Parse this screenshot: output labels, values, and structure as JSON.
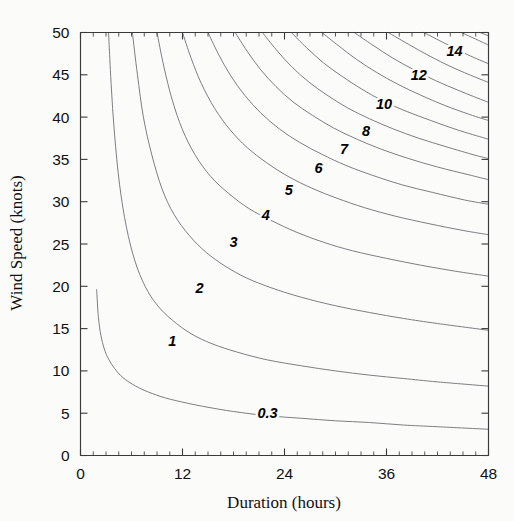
{
  "chart_data": {
    "type": "line",
    "title": "",
    "subtitle": "",
    "xlabel": "Duration (hours)",
    "ylabel": "Wind Speed (knots)",
    "xlim": [
      0,
      48
    ],
    "ylim": [
      0,
      50
    ],
    "xticks": [
      0,
      12,
      24,
      36,
      48
    ],
    "xtick_labels": [
      "0",
      "12",
      "24",
      "36",
      "48"
    ],
    "x_minor_tick_interval": 1.5,
    "yticks": [
      0,
      5,
      10,
      15,
      20,
      25,
      30,
      35,
      40,
      45,
      50
    ],
    "ytick_labels": [
      "0",
      "5",
      "10",
      "15",
      "20",
      "25",
      "30",
      "35",
      "40",
      "45",
      "50"
    ],
    "grid": false,
    "legend": "none",
    "annotations": [
      {
        "text": "0.3",
        "x": 22.0,
        "y": 4.4
      },
      {
        "text": "1",
        "x": 10.8,
        "y": 13.0
      },
      {
        "text": "2",
        "x": 14.0,
        "y": 19.2
      },
      {
        "text": "3",
        "x": 18.0,
        "y": 24.6
      },
      {
        "text": "4",
        "x": 21.8,
        "y": 27.8
      },
      {
        "text": "5",
        "x": 24.5,
        "y": 30.8
      },
      {
        "text": "6",
        "x": 28.0,
        "y": 33.4
      },
      {
        "text": "7",
        "x": 31.0,
        "y": 35.6
      },
      {
        "text": "8",
        "x": 33.6,
        "y": 37.8
      },
      {
        "text": "10",
        "x": 35.7,
        "y": 41.0
      },
      {
        "text": "12",
        "x": 39.8,
        "y": 44.4
      },
      {
        "text": "14",
        "x": 44.0,
        "y": 47.2
      }
    ],
    "contour_levels": [
      0.3,
      1,
      2,
      3,
      4,
      5,
      6,
      7,
      8,
      10,
      12,
      14
    ],
    "contour_label": "Significant wave height",
    "series": [
      {
        "name": "0.3",
        "points": [
          [
            1.9,
            19.6
          ],
          [
            2.1,
            16.4
          ],
          [
            2.4,
            14.2
          ],
          [
            2.8,
            12.6
          ],
          [
            3.3,
            11.4
          ],
          [
            4.0,
            10.3
          ],
          [
            5.0,
            9.2
          ],
          [
            6.5,
            8.2
          ],
          [
            8.0,
            7.5
          ],
          [
            10.0,
            6.8
          ],
          [
            12.5,
            6.2
          ],
          [
            15.0,
            5.7
          ],
          [
            18.0,
            5.2
          ],
          [
            22.0,
            4.7
          ],
          [
            26.0,
            4.4
          ],
          [
            30.0,
            4.1
          ],
          [
            34.0,
            3.9
          ],
          [
            38.0,
            3.6
          ],
          [
            42.0,
            3.4
          ],
          [
            48.0,
            3.1
          ]
        ]
      },
      {
        "name": "1",
        "points": [
          [
            3.3,
            50.0
          ],
          [
            3.6,
            44.0
          ],
          [
            4.0,
            38.0
          ],
          [
            4.6,
            32.0
          ],
          [
            5.4,
            27.0
          ],
          [
            6.4,
            23.0
          ],
          [
            7.6,
            20.0
          ],
          [
            9.0,
            17.8
          ],
          [
            10.8,
            16.0
          ],
          [
            13.0,
            14.4
          ],
          [
            15.5,
            13.2
          ],
          [
            18.5,
            12.2
          ],
          [
            22.0,
            11.3
          ],
          [
            26.0,
            10.6
          ],
          [
            30.0,
            10.0
          ],
          [
            34.0,
            9.5
          ],
          [
            38.0,
            9.1
          ],
          [
            42.0,
            8.7
          ],
          [
            48.0,
            8.2
          ]
        ]
      },
      {
        "name": "2",
        "points": [
          [
            6.1,
            50.0
          ],
          [
            6.7,
            45.0
          ],
          [
            7.4,
            40.0
          ],
          [
            8.4,
            35.5
          ],
          [
            9.6,
            31.5
          ],
          [
            11.0,
            28.5
          ],
          [
            12.8,
            26.0
          ],
          [
            14.8,
            24.0
          ],
          [
            17.0,
            22.4
          ],
          [
            19.5,
            21.0
          ],
          [
            22.5,
            19.8
          ],
          [
            26.0,
            18.7
          ],
          [
            30.0,
            17.7
          ],
          [
            34.0,
            16.9
          ],
          [
            38.0,
            16.2
          ],
          [
            42.0,
            15.6
          ],
          [
            48.0,
            14.8
          ]
        ]
      },
      {
        "name": "3",
        "points": [
          [
            9.0,
            50.0
          ],
          [
            9.8,
            46.0
          ],
          [
            10.8,
            42.0
          ],
          [
            12.0,
            38.5
          ],
          [
            13.5,
            35.5
          ],
          [
            15.3,
            33.0
          ],
          [
            17.4,
            31.0
          ],
          [
            19.8,
            29.2
          ],
          [
            22.4,
            27.8
          ],
          [
            25.4,
            26.4
          ],
          [
            28.6,
            25.2
          ],
          [
            32.0,
            24.2
          ],
          [
            36.0,
            23.3
          ],
          [
            40.0,
            22.5
          ],
          [
            44.0,
            21.8
          ],
          [
            48.0,
            21.2
          ]
        ]
      },
      {
        "name": "4",
        "points": [
          [
            12.0,
            50.0
          ],
          [
            13.0,
            47.0
          ],
          [
            14.2,
            44.0
          ],
          [
            15.8,
            41.0
          ],
          [
            17.6,
            38.5
          ],
          [
            19.6,
            36.4
          ],
          [
            21.9,
            34.6
          ],
          [
            24.4,
            33.0
          ],
          [
            27.2,
            31.6
          ],
          [
            30.2,
            30.4
          ],
          [
            33.4,
            29.3
          ],
          [
            37.0,
            28.3
          ],
          [
            41.0,
            27.4
          ],
          [
            45.0,
            26.6
          ],
          [
            48.0,
            26.1
          ]
        ]
      },
      {
        "name": "5",
        "points": [
          [
            15.0,
            50.0
          ],
          [
            16.2,
            47.5
          ],
          [
            17.6,
            45.0
          ],
          [
            19.3,
            42.6
          ],
          [
            21.2,
            40.5
          ],
          [
            23.4,
            38.6
          ],
          [
            25.8,
            37.0
          ],
          [
            28.4,
            35.6
          ],
          [
            31.2,
            34.3
          ],
          [
            34.4,
            33.1
          ],
          [
            37.8,
            32.0
          ],
          [
            41.4,
            31.1
          ],
          [
            45.2,
            30.2
          ],
          [
            48.0,
            29.7
          ]
        ]
      },
      {
        "name": "6",
        "points": [
          [
            18.2,
            50.0
          ],
          [
            19.6,
            47.8
          ],
          [
            21.2,
            45.6
          ],
          [
            23.0,
            43.6
          ],
          [
            25.0,
            41.8
          ],
          [
            27.3,
            40.2
          ],
          [
            29.8,
            38.7
          ],
          [
            32.5,
            37.4
          ],
          [
            35.4,
            36.2
          ],
          [
            38.6,
            35.1
          ],
          [
            42.0,
            34.1
          ],
          [
            45.6,
            33.2
          ],
          [
            48.0,
            32.6
          ]
        ]
      },
      {
        "name": "7",
        "points": [
          [
            21.4,
            50.0
          ],
          [
            23.0,
            48.0
          ],
          [
            24.8,
            46.0
          ],
          [
            26.8,
            44.2
          ],
          [
            29.0,
            42.6
          ],
          [
            31.4,
            41.1
          ],
          [
            34.0,
            39.8
          ],
          [
            36.8,
            38.6
          ],
          [
            39.8,
            37.5
          ],
          [
            43.0,
            36.5
          ],
          [
            46.4,
            35.5
          ],
          [
            48.0,
            35.1
          ]
        ]
      },
      {
        "name": "8",
        "points": [
          [
            24.8,
            50.0
          ],
          [
            26.6,
            48.2
          ],
          [
            28.6,
            46.4
          ],
          [
            30.8,
            44.8
          ],
          [
            33.1,
            43.3
          ],
          [
            35.6,
            41.9
          ],
          [
            38.3,
            40.7
          ],
          [
            41.2,
            39.6
          ],
          [
            44.3,
            38.5
          ],
          [
            47.6,
            37.5
          ],
          [
            48.0,
            37.4
          ]
        ]
      },
      {
        "name": "9",
        "points": [
          [
            28.4,
            50.0
          ],
          [
            30.4,
            48.4
          ],
          [
            32.5,
            46.8
          ],
          [
            34.8,
            45.3
          ],
          [
            37.3,
            43.9
          ],
          [
            40.0,
            42.6
          ],
          [
            42.8,
            41.4
          ],
          [
            45.8,
            40.3
          ],
          [
            48.0,
            39.6
          ]
        ]
      },
      {
        "name": "10",
        "points": [
          [
            32.2,
            50.0
          ],
          [
            34.4,
            48.5
          ],
          [
            36.7,
            47.0
          ],
          [
            39.2,
            45.6
          ],
          [
            41.8,
            44.3
          ],
          [
            44.6,
            43.1
          ],
          [
            47.6,
            41.9
          ],
          [
            48.0,
            41.8
          ]
        ]
      },
      {
        "name": "11",
        "points": [
          [
            36.2,
            50.0
          ],
          [
            38.6,
            48.6
          ],
          [
            41.1,
            47.2
          ],
          [
            43.7,
            45.9
          ],
          [
            46.5,
            44.7
          ],
          [
            48.0,
            44.1
          ]
        ]
      },
      {
        "name": "12",
        "points": [
          [
            40.4,
            50.0
          ],
          [
            42.9,
            48.7
          ],
          [
            45.5,
            47.4
          ],
          [
            48.0,
            46.3
          ]
        ]
      },
      {
        "name": "13",
        "points": [
          [
            44.8,
            50.0
          ],
          [
            47.4,
            48.8
          ],
          [
            48.0,
            48.5
          ]
        ]
      },
      {
        "name": "14",
        "points": [
          [
            47.0,
            50.0
          ],
          [
            48.0,
            49.6
          ]
        ]
      }
    ]
  },
  "figure": {
    "xlabel": "Duration (hours)",
    "ylabel": "Wind Speed (knots)"
  }
}
